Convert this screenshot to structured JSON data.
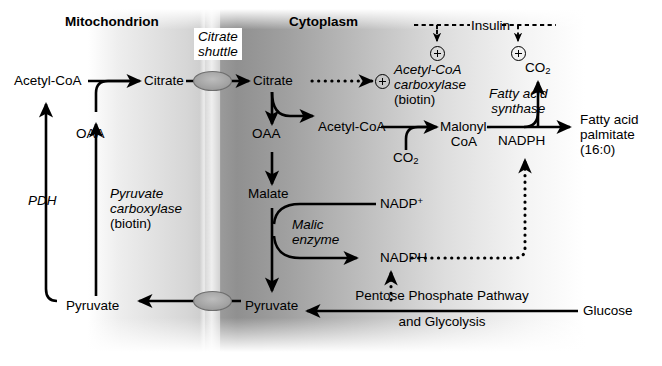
{
  "figure": {
    "type": "pathway-diagram"
  },
  "compartments": {
    "left": "Mitochondrion",
    "right": "Cytoplasm",
    "membrane_label_line1": "Citrate",
    "membrane_label_line2": "shuttle"
  },
  "metabolites": {
    "acetyl_coa_mito": "Acetyl-CoA",
    "citrate_mito": "Citrate",
    "oaa_mito": "OAA",
    "pyruvate_mito": "Pyruvate",
    "citrate_cyto": "Citrate",
    "oaa_cyto": "OAA",
    "malate": "Malate",
    "pyruvate_cyto": "Pyruvate",
    "acetyl_coa_cyto": "Acetyl-CoA",
    "malonyl_coa_line1": "Malonyl-",
    "malonyl_coa_line2": "CoA",
    "glucose": "Glucose",
    "product_line1": "Fatty acid",
    "product_line2": "palmitate",
    "product_line3": "(16:0)"
  },
  "cofactors": {
    "co2_carboxylase": "CO2",
    "co2_synthase": "CO2",
    "nadp_plus": "NADP+",
    "nadph_malic": "NADPH",
    "nadph_synthase": "NADPH"
  },
  "enzymes": {
    "pdh": "PDH",
    "pyruvate_carboxylase_line1": "Pyruvate",
    "pyruvate_carboxylase_line2": "carboxylase",
    "pyruvate_carboxylase_cofactor": "(biotin)",
    "malic_enzyme_line1": "Malic",
    "malic_enzyme_line2": "enzyme",
    "acc_line1": "Acetyl-CoA",
    "acc_line2": "carboxylase",
    "acc_cofactor": "(biotin)",
    "fas_line1": "Fatty acid",
    "fas_line2": "synthase"
  },
  "pathways": {
    "ppp_line1": "Pentose Phosphate Pathway",
    "ppp_line2": "and Glycolysis"
  },
  "regulation": {
    "hormone": "Insulin",
    "activation_symbol": "+",
    "targets": [
      "Acetyl-CoA carboxylase",
      "Fatty acid synthase"
    ]
  },
  "colors": {
    "ink": "#000000",
    "membrane_light": "#e2e2e2",
    "membrane_dark": "#8e8e8e",
    "transporter_fill": "#a8a8a8"
  }
}
